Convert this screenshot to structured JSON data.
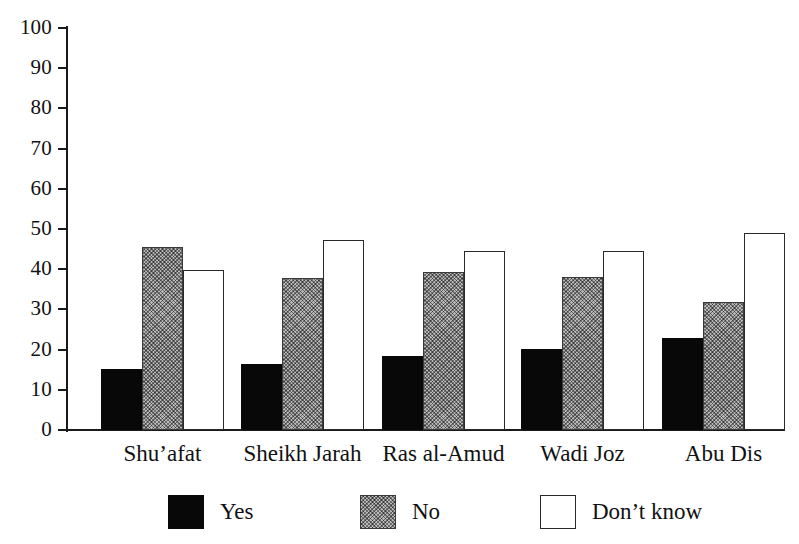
{
  "chart_data": {
    "type": "bar",
    "title": "",
    "subtitle": "",
    "xlabel": "",
    "ylabel": "",
    "ylim": [
      0,
      100
    ],
    "ytick_step": 10,
    "yticks": [
      100,
      90,
      80,
      70,
      60,
      50,
      40,
      30,
      20,
      10,
      0
    ],
    "grid": false,
    "legend_position": "bottom",
    "categories": [
      "Shu’afat",
      "Sheikh Jarah",
      "Ras al-Amud",
      "Wadi Joz",
      "Abu Dis"
    ],
    "series": [
      {
        "name": "Yes",
        "color": "#080808",
        "fill": "solid-black",
        "values": [
          15.3,
          16.4,
          18.4,
          20.1,
          23.0
        ]
      },
      {
        "name": "No",
        "color": "#b9b9b9",
        "fill": "stipple-gray",
        "values": [
          45.6,
          37.9,
          39.3,
          38.0,
          31.9
        ]
      },
      {
        "name": "Don’t know",
        "color": "#ffffff",
        "fill": "white-outline",
        "values": [
          39.8,
          47.2,
          44.6,
          44.5,
          48.9
        ]
      }
    ]
  },
  "axis": {
    "y": {
      "labels": [
        "100",
        "90",
        "80",
        "70",
        "60",
        "50",
        "40",
        "30",
        "20",
        "10",
        "0"
      ]
    }
  },
  "legend": {
    "items": [
      {
        "label": "Yes"
      },
      {
        "label": "No"
      },
      {
        "label": "Don’t know"
      }
    ]
  },
  "colors": {
    "axis": "#1a1a1a",
    "series_yes": "#080808",
    "series_no": "#b9b9b9",
    "series_dont_know": "#ffffff",
    "background": "#ffffff"
  }
}
